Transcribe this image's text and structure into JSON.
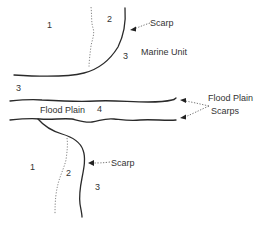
{
  "diagram": {
    "type": "geomorphic sketch",
    "colors": {
      "line": "#2a2a2a",
      "dotted": "#777777",
      "text": "#333333",
      "background": "#ffffff"
    },
    "upper": {
      "unit_labels": [
        {
          "id": "1",
          "text": "1"
        },
        {
          "id": "2",
          "text": "2"
        },
        {
          "id": "3a",
          "text": "3"
        },
        {
          "id": "3b",
          "text": "3"
        }
      ],
      "scarp_label": "Scarp",
      "marine_unit_label": "Marine Unit"
    },
    "middle": {
      "flood_plain_label": "Flood Plain",
      "unit_4_label": "4",
      "flood_plain_scarps_label_line1": "Flood Plain",
      "flood_plain_scarps_label_line2": "Scarps"
    },
    "lower": {
      "unit_labels": [
        {
          "id": "1",
          "text": "1"
        },
        {
          "id": "2",
          "text": "2"
        },
        {
          "id": "3",
          "text": "3"
        }
      ],
      "scarp_label": "Scarp"
    }
  }
}
